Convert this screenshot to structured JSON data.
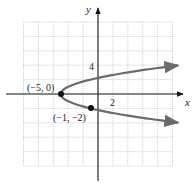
{
  "chart_data": {
    "type": "line",
    "title": "",
    "equation": "x = y^2 - 5",
    "xlabel": "x",
    "ylabel": "y",
    "xlim": [
      -10,
      10
    ],
    "ylim": [
      -10,
      10
    ],
    "grid": true,
    "grid_step": 2,
    "tick_labels": {
      "x": [
        "2"
      ],
      "y": [
        "4"
      ]
    },
    "series": [
      {
        "name": "parabola",
        "color": "#6b6b6b",
        "points": [
          {
            "x": 10.8,
            "y": -3.97
          },
          {
            "x": 4,
            "y": -3
          },
          {
            "x": -1,
            "y": -2
          },
          {
            "x": -4,
            "y": -1
          },
          {
            "x": -5,
            "y": 0
          },
          {
            "x": -4,
            "y": 1
          },
          {
            "x": -1,
            "y": 2
          },
          {
            "x": 4,
            "y": 3
          },
          {
            "x": 10.8,
            "y": 3.97
          }
        ]
      }
    ],
    "annotations": [
      {
        "label": "(−5, 0)",
        "x": -5,
        "y": 0
      },
      {
        "label": "(−1, −2)",
        "x": -1,
        "y": -2
      }
    ]
  },
  "labels": {
    "x_axis": "x",
    "y_axis": "y",
    "x_tick": "2",
    "y_tick": "4",
    "vertex": "(−5, 0)",
    "point": "(−1, −2)"
  }
}
